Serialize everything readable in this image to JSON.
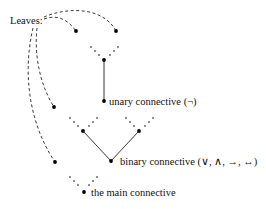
{
  "diagram": {
    "leaves_label": "Leaves:",
    "labels": {
      "unary": "unary connective (¬)",
      "binary": "binary connective (∨, ∧, →, ↔)",
      "main": "the main connective"
    },
    "nodes": [
      {
        "id": "leaf-1",
        "kind": "leaf"
      },
      {
        "id": "leaf-2",
        "kind": "leaf"
      },
      {
        "id": "leaf-3",
        "kind": "leaf"
      },
      {
        "id": "leaf-4",
        "kind": "leaf"
      },
      {
        "id": "unary-top",
        "kind": "internal"
      },
      {
        "id": "unary",
        "kind": "unary-connective"
      },
      {
        "id": "binary-left-child",
        "kind": "internal"
      },
      {
        "id": "binary-right-child",
        "kind": "internal"
      },
      {
        "id": "binary",
        "kind": "binary-connective"
      },
      {
        "id": "main",
        "kind": "main-connective"
      }
    ],
    "edges": [
      {
        "from": "unary-top",
        "to": "unary",
        "style": "solid"
      },
      {
        "from": "binary-left-child",
        "to": "binary",
        "style": "solid"
      },
      {
        "from": "binary-right-child",
        "to": "binary",
        "style": "solid"
      }
    ],
    "pointers": [
      {
        "from": "leaves-label",
        "to": "leaf-1",
        "style": "dashed"
      },
      {
        "from": "leaves-label",
        "to": "leaf-2",
        "style": "dashed"
      },
      {
        "from": "leaves-label",
        "to": "leaf-3",
        "style": "dashed"
      },
      {
        "from": "leaves-label",
        "to": "leaf-4",
        "style": "dashed"
      }
    ]
  }
}
